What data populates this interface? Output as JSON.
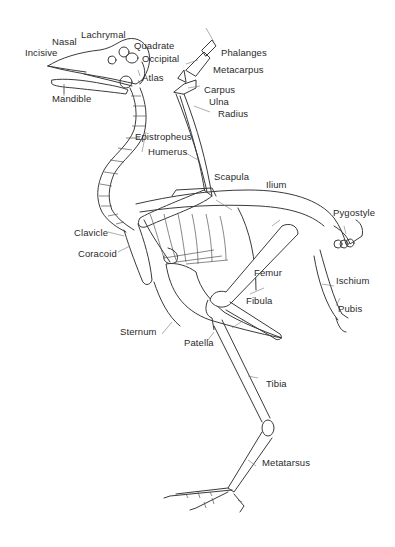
{
  "diagram": {
    "labels": {
      "incisive": "Incisive",
      "nasal": "Nasal",
      "lachrymal": "Lachrymal",
      "quadrate": "Quadrate",
      "occipital": "Occipital",
      "atlas": "Atlas",
      "mandible": "Mandible",
      "epistropheus": "Epistropheus",
      "phalanges": "Phalanges",
      "metacarpus": "Metacarpus",
      "carpus": "Carpus",
      "ulna": "Ulna",
      "radius": "Radius",
      "humerus": "Humerus",
      "scapula": "Scapula",
      "ilium": "Ilium",
      "pygostyle": "Pygostyle",
      "clavicle": "Clavicle",
      "coracoid": "Coracoid",
      "femur": "Femur",
      "ischium": "Ischium",
      "pubis": "Pubis",
      "fibula": "Fibula",
      "sternum": "Sternum",
      "patella": "Patella",
      "tibia": "Tibia",
      "metatarsus": "Metatarsus"
    }
  }
}
